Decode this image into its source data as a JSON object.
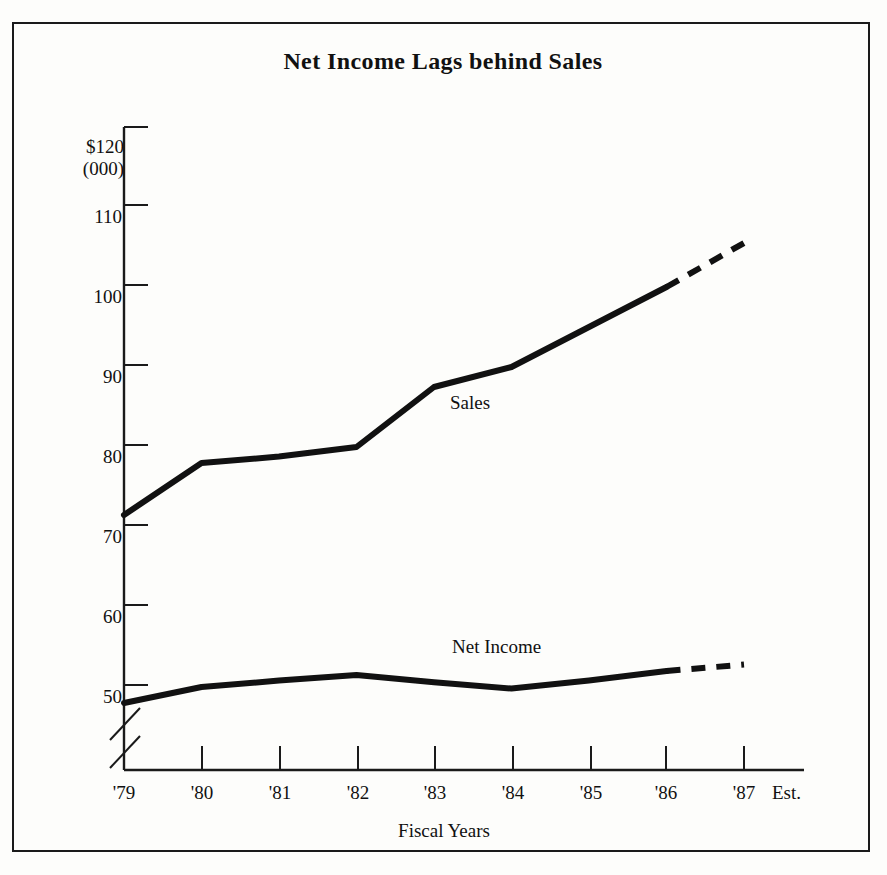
{
  "figure": {
    "title": "Net Income Lags behind Sales",
    "border_color": "#1a1a1a",
    "background": "#fdfdfb",
    "ink_color": "#111111"
  },
  "chart_data": {
    "type": "line",
    "title": "Net Income Lags behind Sales",
    "xlabel": "Fiscal Years",
    "ylabel": "$120\n(000)",
    "y_unit_label_line1": "$120",
    "y_unit_label_line2": "(000)",
    "categories": [
      "'79",
      "'80",
      "'81",
      "'82",
      "'83",
      "'84",
      "'85",
      "'86",
      "'87"
    ],
    "x_tick_labels": [
      "'79",
      "'80",
      "'81",
      "'82",
      "'83",
      "'84",
      "'85",
      "'86",
      "'87"
    ],
    "x_last_annotation": "Est.",
    "y_tick_labels": [
      "$120",
      "110",
      "100",
      "90",
      "80",
      "70",
      "60",
      "50"
    ],
    "y_ticks": [
      120,
      110,
      100,
      90,
      80,
      70,
      60,
      50
    ],
    "ylim": [
      45,
      120
    ],
    "axis_break": true,
    "grid": false,
    "legend": "inline-labels",
    "series": [
      {
        "name": "Sales",
        "label": "Sales",
        "values": [
          71.5,
          78.0,
          78.8,
          80.0,
          87.5,
          90.0,
          95.0,
          100.0,
          105.5
        ],
        "solid_through": "'86",
        "dashed_from": "'86",
        "dashed_to": "'87"
      },
      {
        "name": "Net Income",
        "label": "Net Income",
        "values": [
          48.0,
          50.0,
          50.8,
          51.5,
          50.6,
          49.8,
          50.8,
          52.0,
          52.8
        ],
        "solid_through": "'86",
        "dashed_from": "'86",
        "dashed_to": "'87"
      }
    ]
  }
}
